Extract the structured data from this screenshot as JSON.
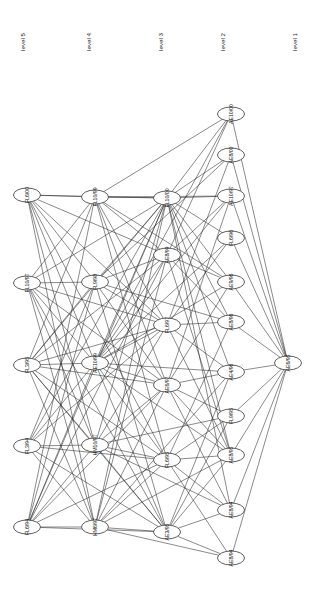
{
  "figure": {
    "type": "layered-graph",
    "orientation": "rotated-90",
    "background": "#ffffff",
    "edge_color": "#2b2b2b",
    "node_fill": "#ffffff",
    "node_stroke": "#1a1a1a"
  },
  "level_labels": [
    {
      "id": "level5",
      "text": "level 5",
      "x": 22,
      "y": 42
    },
    {
      "id": "level4",
      "text": "level 4",
      "x": 88,
      "y": 42
    },
    {
      "id": "level3",
      "text": "level 3",
      "x": 160,
      "y": 42
    },
    {
      "id": "level2",
      "text": "level 2",
      "x": 222,
      "y": 42
    },
    {
      "id": "level1",
      "text": "level 1",
      "x": 294,
      "y": 42
    }
  ],
  "nodes": [
    {
      "id": "n0",
      "label": "AE6/95",
      "x": 288,
      "y": 363,
      "level": 0
    },
    {
      "id": "n1",
      "label": "AE10/00",
      "x": 231,
      "y": 114,
      "level": 1
    },
    {
      "id": "n2",
      "label": "AE8/00",
      "x": 231,
      "y": 155,
      "level": 1
    },
    {
      "id": "n3",
      "label": "AE10/97",
      "x": 231,
      "y": 196,
      "level": 1
    },
    {
      "id": "n4",
      "label": "FL6/96",
      "x": 231,
      "y": 238,
      "level": 1
    },
    {
      "id": "n5",
      "label": "AE9/96",
      "x": 231,
      "y": 282,
      "level": 1
    },
    {
      "id": "n6",
      "label": "AE8/96",
      "x": 231,
      "y": 322,
      "level": 1
    },
    {
      "id": "n7",
      "label": "AE4/96",
      "x": 231,
      "y": 372,
      "level": 1
    },
    {
      "id": "n8",
      "label": "FL9/95",
      "x": 231,
      "y": 416,
      "level": 1
    },
    {
      "id": "n9",
      "label": "AE8/95",
      "x": 231,
      "y": 455,
      "level": 1
    },
    {
      "id": "n10",
      "label": "AE8/94",
      "x": 231,
      "y": 510,
      "level": 1
    },
    {
      "id": "n11",
      "label": "AE8/94",
      "x": 231,
      "y": 558,
      "level": 1
    },
    {
      "id": "n12",
      "label": "FL10/00",
      "x": 167,
      "y": 198,
      "level": 2
    },
    {
      "id": "n13",
      "label": "AE8/99",
      "x": 167,
      "y": 255,
      "level": 2
    },
    {
      "id": "n14",
      "label": "FL6/97",
      "x": 167,
      "y": 325,
      "level": 2
    },
    {
      "id": "n15",
      "label": "AE6/97",
      "x": 167,
      "y": 385,
      "level": 2
    },
    {
      "id": "n16",
      "label": "FL6/95",
      "x": 167,
      "y": 460,
      "level": 2
    },
    {
      "id": "n17",
      "label": "AE3/95",
      "x": 167,
      "y": 532,
      "level": 2
    },
    {
      "id": "n18",
      "label": "FL10/99",
      "x": 95,
      "y": 197,
      "level": 3
    },
    {
      "id": "n19",
      "label": "FL9/98",
      "x": 95,
      "y": 282,
      "level": 3
    },
    {
      "id": "n20",
      "label": "AE10/99",
      "x": 95,
      "y": 363,
      "level": 3
    },
    {
      "id": "n21",
      "label": "HM10/97",
      "x": 95,
      "y": 445,
      "level": 3
    },
    {
      "id": "n22",
      "label": "HM6/97",
      "x": 95,
      "y": 527,
      "level": 3
    },
    {
      "id": "n23",
      "label": "FL6/00",
      "x": 27,
      "y": 195,
      "level": 4
    },
    {
      "id": "n24",
      "label": "FL10/97",
      "x": 27,
      "y": 283,
      "level": 4
    },
    {
      "id": "n25",
      "label": "FL3/95",
      "x": 27,
      "y": 365,
      "level": 4
    },
    {
      "id": "n26",
      "label": "FL3/94",
      "x": 27,
      "y": 446,
      "level": 4
    },
    {
      "id": "n27",
      "label": "FL6/94",
      "x": 27,
      "y": 527,
      "level": 4
    }
  ],
  "edges": [
    [
      "n1",
      "n0"
    ],
    [
      "n2",
      "n0"
    ],
    [
      "n3",
      "n0"
    ],
    [
      "n5",
      "n0"
    ],
    [
      "n6",
      "n0"
    ],
    [
      "n7",
      "n0"
    ],
    [
      "n8",
      "n0"
    ],
    [
      "n9",
      "n0"
    ],
    [
      "n10",
      "n0"
    ],
    [
      "n11",
      "n0"
    ],
    [
      "n4",
      "n0"
    ],
    [
      "n12",
      "n1"
    ],
    [
      "n12",
      "n2"
    ],
    [
      "n12",
      "n3"
    ],
    [
      "n12",
      "n4"
    ],
    [
      "n12",
      "n5"
    ],
    [
      "n12",
      "n6"
    ],
    [
      "n12",
      "n7"
    ],
    [
      "n12",
      "n9"
    ],
    [
      "n12",
      "n10"
    ],
    [
      "n13",
      "n1"
    ],
    [
      "n13",
      "n3"
    ],
    [
      "n13",
      "n5"
    ],
    [
      "n13",
      "n6"
    ],
    [
      "n13",
      "n9"
    ],
    [
      "n14",
      "n2"
    ],
    [
      "n14",
      "n4"
    ],
    [
      "n14",
      "n6"
    ],
    [
      "n14",
      "n7"
    ],
    [
      "n14",
      "n9"
    ],
    [
      "n15",
      "n3"
    ],
    [
      "n15",
      "n5"
    ],
    [
      "n15",
      "n7"
    ],
    [
      "n15",
      "n8"
    ],
    [
      "n15",
      "n9"
    ],
    [
      "n15",
      "n10"
    ],
    [
      "n16",
      "n6"
    ],
    [
      "n16",
      "n8"
    ],
    [
      "n16",
      "n9"
    ],
    [
      "n16",
      "n10"
    ],
    [
      "n16",
      "n11"
    ],
    [
      "n17",
      "n7"
    ],
    [
      "n17",
      "n9"
    ],
    [
      "n17",
      "n10"
    ],
    [
      "n17",
      "n11"
    ],
    [
      "n17",
      "n8"
    ],
    [
      "n18",
      "n12"
    ],
    [
      "n18",
      "n13"
    ],
    [
      "n18",
      "n14"
    ],
    [
      "n18",
      "n15"
    ],
    [
      "n18",
      "n16"
    ],
    [
      "n19",
      "n12"
    ],
    [
      "n19",
      "n13"
    ],
    [
      "n19",
      "n14"
    ],
    [
      "n19",
      "n15"
    ],
    [
      "n19",
      "n17"
    ],
    [
      "n20",
      "n12"
    ],
    [
      "n20",
      "n13"
    ],
    [
      "n20",
      "n14"
    ],
    [
      "n20",
      "n15"
    ],
    [
      "n20",
      "n16"
    ],
    [
      "n20",
      "n17"
    ],
    [
      "n21",
      "n12"
    ],
    [
      "n21",
      "n14"
    ],
    [
      "n21",
      "n15"
    ],
    [
      "n21",
      "n16"
    ],
    [
      "n21",
      "n17"
    ],
    [
      "n22",
      "n12"
    ],
    [
      "n22",
      "n13"
    ],
    [
      "n22",
      "n15"
    ],
    [
      "n22",
      "n16"
    ],
    [
      "n22",
      "n17"
    ],
    [
      "n18",
      "n1"
    ],
    [
      "n18",
      "n3"
    ],
    [
      "n18",
      "n5"
    ],
    [
      "n19",
      "n2"
    ],
    [
      "n19",
      "n6"
    ],
    [
      "n20",
      "n1"
    ],
    [
      "n20",
      "n3"
    ],
    [
      "n20",
      "n4"
    ],
    [
      "n20",
      "n5"
    ],
    [
      "n20",
      "n7"
    ],
    [
      "n20",
      "n9"
    ],
    [
      "n21",
      "n8"
    ],
    [
      "n21",
      "n10"
    ],
    [
      "n22",
      "n9"
    ],
    [
      "n22",
      "n11"
    ],
    [
      "n22",
      "n7"
    ],
    [
      "n23",
      "n18"
    ],
    [
      "n23",
      "n19"
    ],
    [
      "n23",
      "n20"
    ],
    [
      "n23",
      "n21"
    ],
    [
      "n23",
      "n22"
    ],
    [
      "n24",
      "n18"
    ],
    [
      "n24",
      "n19"
    ],
    [
      "n24",
      "n20"
    ],
    [
      "n24",
      "n21"
    ],
    [
      "n24",
      "n22"
    ],
    [
      "n25",
      "n18"
    ],
    [
      "n25",
      "n19"
    ],
    [
      "n25",
      "n20"
    ],
    [
      "n25",
      "n21"
    ],
    [
      "n25",
      "n22"
    ],
    [
      "n26",
      "n19"
    ],
    [
      "n26",
      "n20"
    ],
    [
      "n26",
      "n21"
    ],
    [
      "n26",
      "n22"
    ],
    [
      "n27",
      "n18"
    ],
    [
      "n27",
      "n19"
    ],
    [
      "n27",
      "n20"
    ],
    [
      "n27",
      "n21"
    ],
    [
      "n27",
      "n22"
    ],
    [
      "n23",
      "n12"
    ],
    [
      "n23",
      "n13"
    ],
    [
      "n23",
      "n14"
    ],
    [
      "n23",
      "n16"
    ],
    [
      "n24",
      "n12"
    ],
    [
      "n24",
      "n14"
    ],
    [
      "n24",
      "n15"
    ],
    [
      "n24",
      "n17"
    ],
    [
      "n25",
      "n12"
    ],
    [
      "n25",
      "n13"
    ],
    [
      "n25",
      "n14"
    ],
    [
      "n25",
      "n15"
    ],
    [
      "n25",
      "n16"
    ],
    [
      "n25",
      "n17"
    ],
    [
      "n26",
      "n12"
    ],
    [
      "n26",
      "n14"
    ],
    [
      "n26",
      "n16"
    ],
    [
      "n26",
      "n17"
    ],
    [
      "n27",
      "n12"
    ],
    [
      "n27",
      "n13"
    ],
    [
      "n27",
      "n15"
    ],
    [
      "n27",
      "n16"
    ],
    [
      "n27",
      "n17"
    ]
  ],
  "node_shape": {
    "rx": 13.5,
    "ry": 7.0
  }
}
